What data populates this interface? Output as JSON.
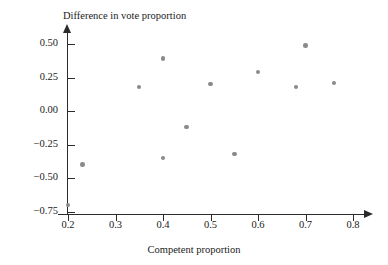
{
  "chart_data": {
    "type": "scatter",
    "title": "",
    "xlabel": "Competent proportion",
    "ylabel": "Difference in vote proportion",
    "xlim": [
      0.17,
      0.83
    ],
    "ylim": [
      -0.78,
      0.58
    ],
    "grid": false,
    "legend": null,
    "marker_color": "#8a8a8a",
    "axis_color": "#2b2b2b",
    "xticks": [
      "0.2",
      "0.3",
      "0.4",
      "0.5",
      "0.6",
      "0.7",
      "0.8"
    ],
    "xtick_values": [
      0.2,
      0.3,
      0.4,
      0.5,
      0.6,
      0.7,
      0.8
    ],
    "yticks": [
      "0.50",
      "0.25",
      "0.00",
      "−0.25",
      "−0.50",
      "−0.75"
    ],
    "ytick_values": [
      0.5,
      0.25,
      0.0,
      -0.25,
      -0.5,
      -0.75
    ],
    "points": [
      {
        "x": 0.2,
        "y": -0.7
      },
      {
        "x": 0.23,
        "y": -0.4
      },
      {
        "x": 0.35,
        "y": 0.18
      },
      {
        "x": 0.4,
        "y": 0.39
      },
      {
        "x": 0.4,
        "y": -0.35
      },
      {
        "x": 0.45,
        "y": -0.12
      },
      {
        "x": 0.5,
        "y": 0.2
      },
      {
        "x": 0.55,
        "y": -0.32
      },
      {
        "x": 0.6,
        "y": 0.29
      },
      {
        "x": 0.68,
        "y": 0.18
      },
      {
        "x": 0.7,
        "y": 0.49
      },
      {
        "x": 0.76,
        "y": 0.21
      }
    ]
  }
}
